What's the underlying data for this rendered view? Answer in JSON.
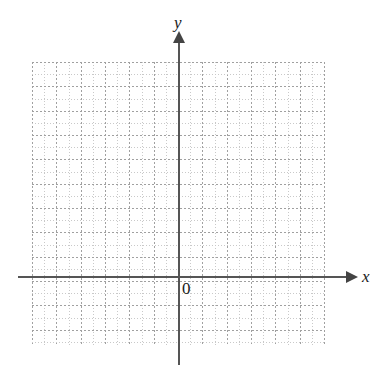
{
  "chart_data": {
    "type": "scatter",
    "title": "",
    "subtitle": "",
    "xlabel": "x",
    "ylabel": "y",
    "origin_label": "0",
    "series": [],
    "x": [],
    "values": [],
    "annotations": [],
    "legend": [],
    "legend_position": "none",
    "grid": true,
    "grid_style": "dotted",
    "grid_minor_step": 1,
    "grid_major_step": 2,
    "xlim": [
      -12,
      12
    ],
    "ylim": [
      -6,
      17.5
    ],
    "x_axis_visible": true,
    "y_axis_visible": true,
    "x_tick_labels": [],
    "y_tick_labels": []
  },
  "labels": {
    "x_axis": "x",
    "y_axis": "y",
    "origin": "0"
  },
  "colors": {
    "background": "#ffffff",
    "axis": "#555555",
    "arrow": "#444444",
    "grid_major": "#a0a0a0",
    "grid_minor": "#c9c9c9",
    "text": "#1a1a1a"
  },
  "geometry": {
    "grid_left": 32,
    "grid_top": 62,
    "grid_width": 292,
    "grid_height": 283,
    "cell_size": 12.17,
    "major_every": 2,
    "x_axis_y": 276,
    "y_axis_x": 178,
    "columns_minor": 24,
    "rows_minor": 23
  }
}
